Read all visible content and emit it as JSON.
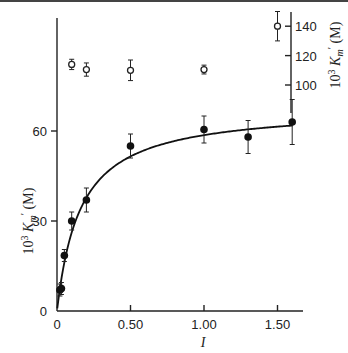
{
  "chart_data": {
    "type": "scatter",
    "title": "",
    "xlabel": "I",
    "ylabel": "10^3 K_m' (M)",
    "y2label": "10^3 K_m' (M)",
    "xlim": [
      0,
      1.65
    ],
    "ylim": [
      0,
      90
    ],
    "y2lim": [
      100,
      145
    ],
    "x_ticks": [
      {
        "value": 0,
        "label": "0"
      },
      {
        "value": 0.5,
        "label": "0.50"
      },
      {
        "value": 1.0,
        "label": "1.00"
      },
      {
        "value": 1.5,
        "label": "1.50"
      }
    ],
    "y_ticks": [
      {
        "value": 0,
        "label": "0"
      },
      {
        "value": 30,
        "label": "30"
      },
      {
        "value": 60,
        "label": "60"
      }
    ],
    "y2_ticks": [
      {
        "value": 100,
        "label": "100"
      },
      {
        "value": 120,
        "label": "120"
      },
      {
        "value": 140,
        "label": "140"
      }
    ],
    "grid": false,
    "series": [
      {
        "name": "filled circles (left axis)",
        "marker": "filled-circle",
        "axis": "left",
        "points": [
          {
            "x": 0.02,
            "y": 7,
            "err": 2
          },
          {
            "x": 0.03,
            "y": 7.5,
            "err": 2
          },
          {
            "x": 0.05,
            "y": 18.5,
            "err": 2
          },
          {
            "x": 0.1,
            "y": 30,
            "err": 3
          },
          {
            "x": 0.2,
            "y": 37,
            "err": 4
          },
          {
            "x": 0.5,
            "y": 55,
            "err": 4
          },
          {
            "x": 1.0,
            "y": 60.5,
            "err": 4.5
          },
          {
            "x": 1.3,
            "y": 58,
            "err": 5.5
          },
          {
            "x": 1.6,
            "y": 63,
            "err": 7.5
          }
        ]
      },
      {
        "name": "open circles (right axis)",
        "marker": "open-circle",
        "axis": "right",
        "points": [
          {
            "x": 0.1,
            "y": 114,
            "err": 3.5
          },
          {
            "x": 0.2,
            "y": 110.5,
            "err": 4.5
          },
          {
            "x": 0.5,
            "y": 110,
            "err": 7
          },
          {
            "x": 1.0,
            "y": 110.5,
            "err": 3
          },
          {
            "x": 1.5,
            "y": 140,
            "err": 10
          }
        ]
      },
      {
        "name": "fitted curve",
        "type": "line",
        "axis": "left",
        "function": "y = 68*x/(0.16+x)",
        "x": [
          0,
          0.05,
          0.1,
          0.2,
          0.3,
          0.5,
          0.75,
          1.0,
          1.25,
          1.6
        ],
        "y": [
          0,
          16.2,
          26.2,
          37.8,
          44.3,
          51.5,
          56.0,
          58.6,
          60.3,
          61.8
        ]
      }
    ]
  }
}
